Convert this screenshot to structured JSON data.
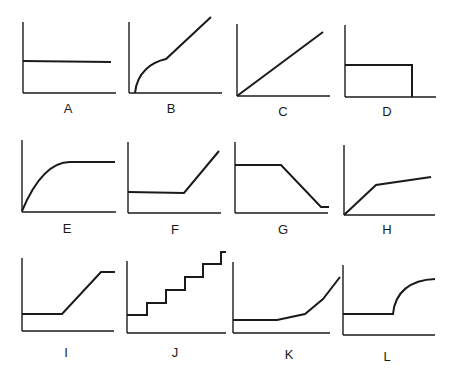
{
  "figure": {
    "line_color": "#1a1a1a",
    "background": "#ffffff"
  },
  "panels": [
    {
      "label": "A",
      "shape": "horizontal constant line",
      "x": 23,
      "y": 22,
      "w": 93,
      "h": 71,
      "lx": 63,
      "ly": 102,
      "path": "M23,61 L111,62"
    },
    {
      "label": "B",
      "shape": "curved concave rise then straight linear rise",
      "x": 129,
      "y": 22,
      "w": 93,
      "h": 71,
      "lx": 166,
      "ly": 102,
      "path": "M135,93 C137,72 152,62 166,59 L211,17"
    },
    {
      "label": "C",
      "shape": "straight line from origin",
      "x": 237,
      "y": 24,
      "w": 93,
      "h": 72,
      "lx": 277,
      "ly": 104,
      "path": "M237,96 L323,32"
    },
    {
      "label": "D",
      "shape": "constant then drops to zero",
      "x": 345,
      "y": 25,
      "w": 91,
      "h": 72,
      "lx": 381,
      "ly": 104,
      "path": "M345,65 L412,65 L412,97"
    },
    {
      "label": "E",
      "shape": "concave rise then plateau",
      "x": 22,
      "y": 140,
      "w": 94,
      "h": 72,
      "lx": 61,
      "ly": 221,
      "path": "M22,211 C35,180 50,162 70,162 L115,162"
    },
    {
      "label": "F",
      "shape": "constant then linear rise",
      "x": 128,
      "y": 142,
      "w": 93,
      "h": 71,
      "lx": 168,
      "ly": 222,
      "path": "M128,192 L184,193 L219,151"
    },
    {
      "label": "G",
      "shape": "constant then linear decline to low constant",
      "x": 235,
      "y": 142,
      "w": 93,
      "h": 71,
      "lx": 277,
      "ly": 222,
      "path": "M235,165 L281,165 L321,207 L329,207"
    },
    {
      "label": "H",
      "shape": "steep linear rise then shallower linear rise",
      "x": 344,
      "y": 145,
      "w": 91,
      "h": 70,
      "lx": 381,
      "ly": 222,
      "path": "M344,215 L376,185 L431,177"
    },
    {
      "label": "I",
      "shape": "constant, linear rise, then plateau",
      "x": 22,
      "y": 258,
      "w": 92,
      "h": 73,
      "lx": 59,
      "ly": 346,
      "path": "M22,314 L62,314 L101,272 L115,272"
    },
    {
      "label": "J",
      "shape": "staircase step increases",
      "x": 127,
      "y": 261,
      "w": 99,
      "h": 72,
      "lx": 169,
      "ly": 346,
      "path": "M127,315 L147,315 L147,303 L166,303 L166,290 L185,290 L185,277 L203,277 L203,264 L221,264 L221,252 L226,252"
    },
    {
      "label": "K",
      "shape": "flat then accelerating increase",
      "x": 233,
      "y": 262,
      "w": 97,
      "h": 71,
      "lx": 283,
      "ly": 348,
      "path": "M233,320 L277,320 L305,314 L323,299 L340,277"
    },
    {
      "label": "L",
      "shape": "constant then convex rise to plateau",
      "x": 343,
      "y": 265,
      "w": 92,
      "h": 70,
      "lx": 381,
      "ly": 350,
      "path": "M343,314 L393,314 C395,292 410,280 435,279"
    }
  ]
}
